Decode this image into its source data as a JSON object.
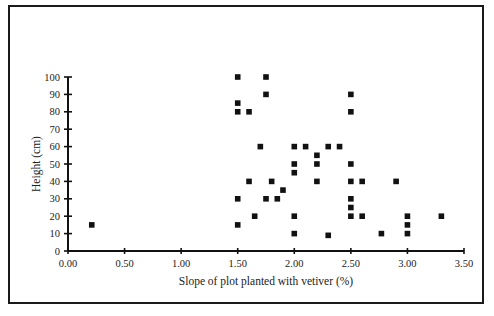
{
  "chart_data": {
    "type": "scatter",
    "title": "",
    "xlabel": "Slope of plot planted with vetiver (%)",
    "ylabel": "Height (cm)",
    "xlim": [
      0,
      3.5
    ],
    "ylim": [
      0,
      100
    ],
    "x_ticks": [
      "0.00",
      "0.50",
      "1.00",
      "1.50",
      "2.00",
      "2.50",
      "3.00",
      "3.50"
    ],
    "y_ticks": [
      "0",
      "10",
      "20",
      "30",
      "40",
      "50",
      "60",
      "70",
      "80",
      "90",
      "100"
    ],
    "grid": false,
    "legend": null,
    "marker": "square",
    "marker_color": "#111111",
    "points": [
      {
        "x": 0.21,
        "y": 15
      },
      {
        "x": 1.5,
        "y": 100
      },
      {
        "x": 1.5,
        "y": 85
      },
      {
        "x": 1.5,
        "y": 80
      },
      {
        "x": 1.5,
        "y": 30
      },
      {
        "x": 1.5,
        "y": 15
      },
      {
        "x": 1.6,
        "y": 80
      },
      {
        "x": 1.6,
        "y": 40
      },
      {
        "x": 1.65,
        "y": 20
      },
      {
        "x": 1.7,
        "y": 60
      },
      {
        "x": 1.75,
        "y": 100
      },
      {
        "x": 1.75,
        "y": 90
      },
      {
        "x": 1.75,
        "y": 30
      },
      {
        "x": 1.8,
        "y": 40
      },
      {
        "x": 1.85,
        "y": 30
      },
      {
        "x": 1.9,
        "y": 35
      },
      {
        "x": 2.0,
        "y": 60
      },
      {
        "x": 2.0,
        "y": 50
      },
      {
        "x": 2.0,
        "y": 45
      },
      {
        "x": 2.0,
        "y": 20
      },
      {
        "x": 2.0,
        "y": 10
      },
      {
        "x": 2.1,
        "y": 60
      },
      {
        "x": 2.2,
        "y": 55
      },
      {
        "x": 2.2,
        "y": 50
      },
      {
        "x": 2.2,
        "y": 40
      },
      {
        "x": 2.3,
        "y": 60
      },
      {
        "x": 2.3,
        "y": 9
      },
      {
        "x": 2.4,
        "y": 60
      },
      {
        "x": 2.5,
        "y": 90
      },
      {
        "x": 2.5,
        "y": 80
      },
      {
        "x": 2.5,
        "y": 50
      },
      {
        "x": 2.5,
        "y": 40
      },
      {
        "x": 2.5,
        "y": 30
      },
      {
        "x": 2.5,
        "y": 25
      },
      {
        "x": 2.5,
        "y": 20
      },
      {
        "x": 2.6,
        "y": 40
      },
      {
        "x": 2.6,
        "y": 20
      },
      {
        "x": 2.77,
        "y": 10
      },
      {
        "x": 2.9,
        "y": 40
      },
      {
        "x": 3.0,
        "y": 20
      },
      {
        "x": 3.0,
        "y": 15
      },
      {
        "x": 3.0,
        "y": 10
      },
      {
        "x": 3.3,
        "y": 20
      }
    ]
  }
}
